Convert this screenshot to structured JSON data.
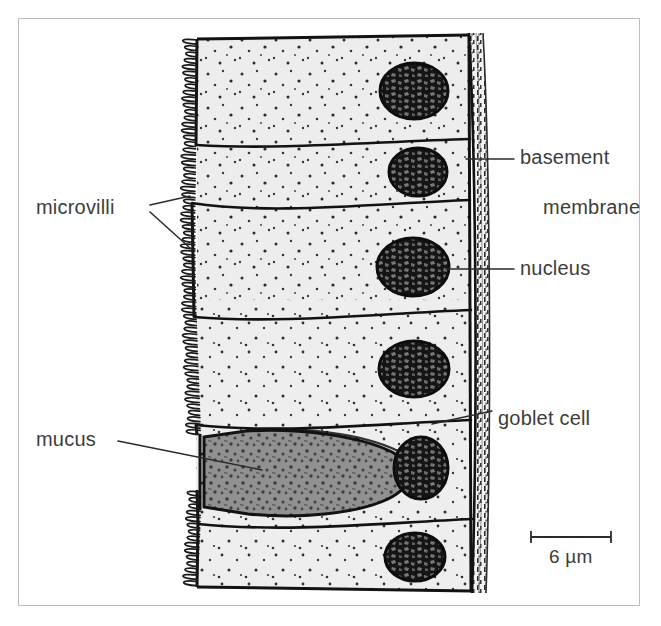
{
  "figure": {
    "background_color": "#ffffff",
    "frame_color": "#bdbdbd"
  },
  "labels": {
    "microvilli": "microvilli",
    "mucus": "mucus",
    "basement_membrane_line1": "basement",
    "basement_membrane_line2": "membrane",
    "nucleus": "nucleus",
    "goblet_cell": "goblet cell"
  },
  "scale_bar": {
    "value": "6",
    "unit": "µm",
    "text": "6 µm",
    "length_px": 80
  },
  "colors": {
    "cytoplasm": "#ececec",
    "nucleus_fill": "#1b1b1b",
    "nucleus_mottle": "#6f6f6f",
    "mucus_fill": "#8d8d8d",
    "mucus_mottle": "#3a3a3a",
    "outline": "#121212",
    "basement_membrane": "#2b2b2b",
    "label_text": "#3d3d3d",
    "leader_line": "#2b2b2b"
  },
  "structures": {
    "cell_count": 6,
    "nucleus_count": 6,
    "goblet_cell_count": 1,
    "microvilli_side": "left",
    "basement_membrane_side": "right"
  }
}
